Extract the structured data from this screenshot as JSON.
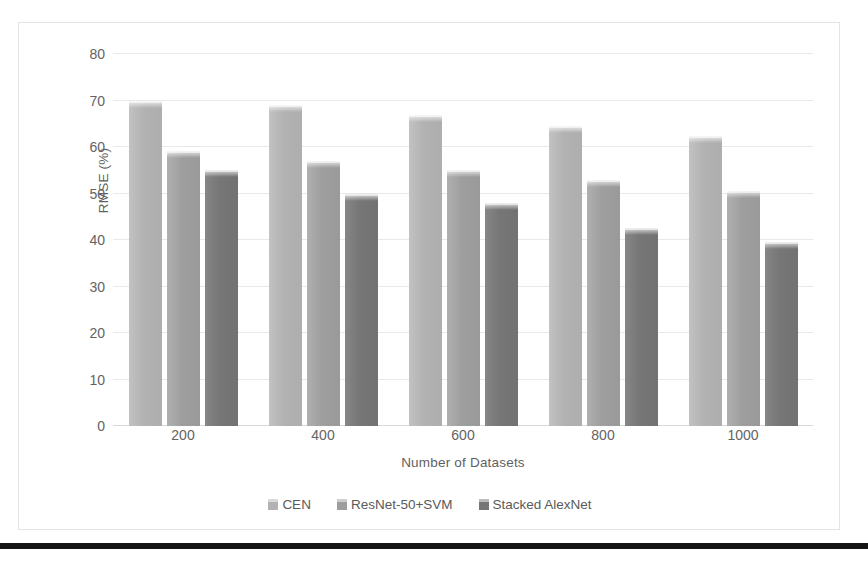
{
  "chart_data": {
    "type": "bar",
    "title": "",
    "xlabel": "Number of Datasets",
    "ylabel": "RMSE (%)",
    "categories": [
      "200",
      "400",
      "600",
      "800",
      "1000"
    ],
    "series": [
      {
        "name": "CEN",
        "color": "#b2b2b2",
        "values": [
          70.0,
          69.0,
          66.8,
          64.6,
          62.4
        ]
      },
      {
        "name": "ResNet-50+SVM",
        "color": "#9e9e9e",
        "values": [
          59.2,
          57.0,
          55.0,
          52.8,
          50.5
        ]
      },
      {
        "name": "Stacked AlexNet",
        "color": "#767676",
        "values": [
          55.0,
          50.0,
          48.0,
          42.6,
          39.6
        ]
      }
    ],
    "ylim": [
      0,
      80
    ],
    "ytick_step": 10,
    "yticks": [
      "80",
      "70",
      "60",
      "50",
      "40",
      "30",
      "20",
      "10",
      "0"
    ],
    "grid": true,
    "legend_position": "bottom"
  },
  "figure": {
    "background_color": "#ffffff",
    "frame_color": "#e3e3e3",
    "gridline_color": "#e9e9e9",
    "tick_label_color": "#636363",
    "axis_title_color": "#5f5f5f",
    "rule_color": "#141414"
  }
}
